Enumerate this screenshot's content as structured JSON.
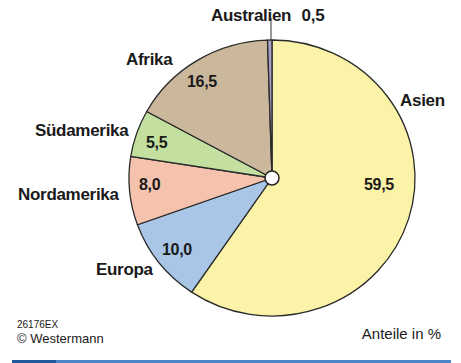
{
  "chart_data": {
    "type": "pie",
    "title": "",
    "unit_label": "Anteile in %",
    "start_angle_deg": 0,
    "direction": "clockwise",
    "slices": [
      {
        "name": "Asien",
        "value": 59.5,
        "label": "59,5",
        "color": "#fbf3a8"
      },
      {
        "name": "Europa",
        "value": 10.0,
        "label": "10,0",
        "color": "#a9c6e6"
      },
      {
        "name": "Nordamerika",
        "value": 8.0,
        "label": "8,0",
        "color": "#f5c3ad"
      },
      {
        "name": "Südamerika",
        "value": 5.5,
        "label": "5,5",
        "color": "#c3e0a0"
      },
      {
        "name": "Afrika",
        "value": 16.5,
        "label": "16,5",
        "color": "#cbb89c"
      },
      {
        "name": "Australien",
        "value": 0.5,
        "label": "0,5",
        "color": "#a8a0c8"
      }
    ],
    "legend": "none",
    "center_marker": true
  },
  "labels": {
    "australien": "Australien",
    "australien_value": "0,5",
    "afrika": "Afrika",
    "afrika_value": "16,5",
    "asien": "Asien",
    "asien_value": "59,5",
    "suedamerika": "Südamerika",
    "suedamerika_value": "5,5",
    "nordamerika": "Nordamerika",
    "nordamerika_value": "8,0",
    "europa": "Europa",
    "europa_value": "10,0"
  },
  "footer": {
    "code": "26176EX",
    "copyright": "© Westermann",
    "unit": "Anteile in %"
  }
}
